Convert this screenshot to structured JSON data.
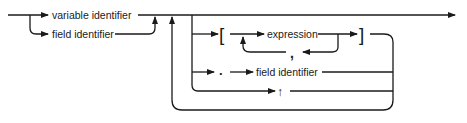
{
  "diagram": {
    "type": "syntax-railroad-diagram",
    "terms": {
      "variable_identifier": "variable identifier",
      "field_identifier_1": "field identifier",
      "open_bracket": "[",
      "expression": "expression",
      "comma": ",",
      "close_bracket": "]",
      "dot": ".",
      "field_identifier_2": "field identifier",
      "caret": "↑"
    },
    "colors": {
      "line": "#1a1a1a",
      "background": "#ffffff"
    }
  }
}
